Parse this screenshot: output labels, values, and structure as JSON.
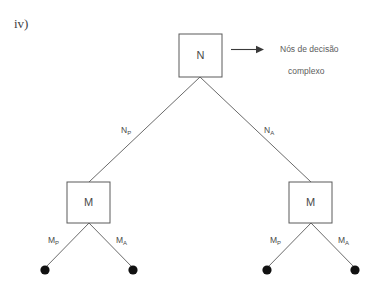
{
  "figure": {
    "enumeration_label": "iv)",
    "background_color": "#ffffff",
    "line_color": "#6b6b6b",
    "text_color": "#4a4a4a"
  },
  "annotation": {
    "arrow_icon": "right-arrow-icon",
    "line1": "Nós de decisão",
    "line2": "complexo"
  },
  "nodes": {
    "root": {
      "label": "N"
    },
    "left_mid": {
      "label": "M"
    },
    "right_mid": {
      "label": "M"
    }
  },
  "edges": {
    "root_left": {
      "base": "N",
      "sub": "P"
    },
    "root_right": {
      "base": "N",
      "sub": "A"
    },
    "left_mid_left": {
      "base": "M",
      "sub": "P"
    },
    "left_mid_right": {
      "base": "M",
      "sub": "A"
    },
    "right_mid_left": {
      "base": "M",
      "sub": "P"
    },
    "right_mid_right": {
      "base": "M",
      "sub": "A"
    }
  },
  "leaves": {
    "count": 4,
    "marker": "filled-circle"
  }
}
